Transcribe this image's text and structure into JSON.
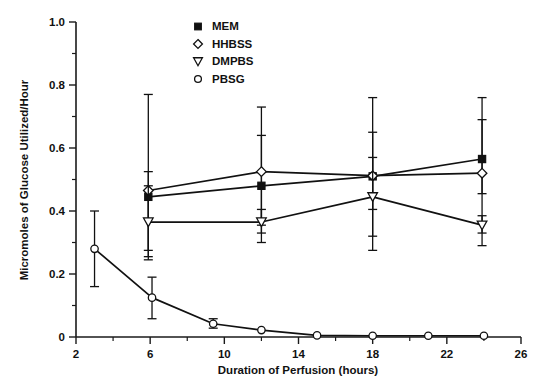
{
  "figure": {
    "title": "",
    "background_color": "#ffffff",
    "ink_color": "#111111"
  },
  "chart_data": {
    "type": "line",
    "title": "",
    "subtitle": "",
    "xlabel": "Duration of Perfusion (hours)",
    "ylabel": "Micromoles of Glucose Utilized/Hour",
    "xlim": [
      2,
      26
    ],
    "ylim": [
      0,
      1.0
    ],
    "grid": false,
    "legend_position": "top-center",
    "x_major_ticks": [
      2,
      6,
      10,
      14,
      18,
      22,
      26
    ],
    "x_major_tick_labels": [
      "2",
      "6",
      "10",
      "14",
      "18",
      "22",
      "26"
    ],
    "x_minor_ticks": [
      4,
      8,
      12,
      16,
      20,
      24
    ],
    "y_major_ticks": [
      0,
      0.2,
      0.4,
      0.6,
      0.8,
      1.0
    ],
    "y_major_tick_labels": [
      "0",
      "0.2",
      "0.4",
      "0.6",
      "0.8",
      "1.0"
    ],
    "y_minor_ticks": [
      0.1,
      0.3,
      0.5,
      0.7,
      0.9
    ],
    "error_bar_type": "symmetric-range",
    "series": [
      {
        "name": "MEM",
        "marker": "filled-square",
        "x": [
          5.9,
          12.0,
          18.0,
          23.9
        ],
        "values": [
          0.445,
          0.48,
          0.51,
          0.565
        ],
        "y_low": [
          0.275,
          0.355,
          0.405,
          0.455
        ],
        "y_high": [
          0.525,
          0.64,
          0.65,
          0.69
        ]
      },
      {
        "name": "HHBSS",
        "marker": "open-diamond",
        "x": [
          5.9,
          12.0,
          18.0,
          23.9
        ],
        "values": [
          0.465,
          0.525,
          0.512,
          0.52
        ],
        "y_low": [
          0.245,
          0.3,
          0.275,
          0.29
        ],
        "y_high": [
          0.77,
          0.73,
          0.76,
          0.76
        ]
      },
      {
        "name": "DMPBS",
        "marker": "open-triangle-down",
        "x": [
          5.9,
          12.0,
          18.0,
          23.9
        ],
        "values": [
          0.365,
          0.365,
          0.445,
          0.355
        ],
        "y_low": [
          0.255,
          0.33,
          0.32,
          0.33
        ],
        "y_high": [
          0.48,
          0.405,
          0.57,
          0.385
        ]
      },
      {
        "name": "PBSG",
        "marker": "open-circle",
        "x": [
          3.0,
          6.1,
          9.4,
          12.0,
          15.0,
          18.0,
          21.0,
          24.0
        ],
        "values": [
          0.28,
          0.125,
          0.042,
          0.022,
          0.005,
          0.004,
          0.004,
          0.004
        ],
        "y_low": [
          0.16,
          0.058,
          0.028,
          0.022,
          0.005,
          0.004,
          0.004,
          0.004
        ],
        "y_high": [
          0.4,
          0.19,
          0.058,
          0.022,
          0.005,
          0.004,
          0.004,
          0.004
        ]
      }
    ]
  },
  "legend": {
    "entries": [
      {
        "label": "MEM",
        "marker": "filled-square"
      },
      {
        "label": "HHBSS",
        "marker": "open-diamond"
      },
      {
        "label": "DMPBS",
        "marker": "open-triangle-down"
      },
      {
        "label": "PBSG",
        "marker": "open-circle"
      }
    ]
  },
  "axes": {
    "x_title": "Duration of Perfusion (hours)",
    "y_title": "Micromoles of Glucose Utilized/Hour"
  }
}
